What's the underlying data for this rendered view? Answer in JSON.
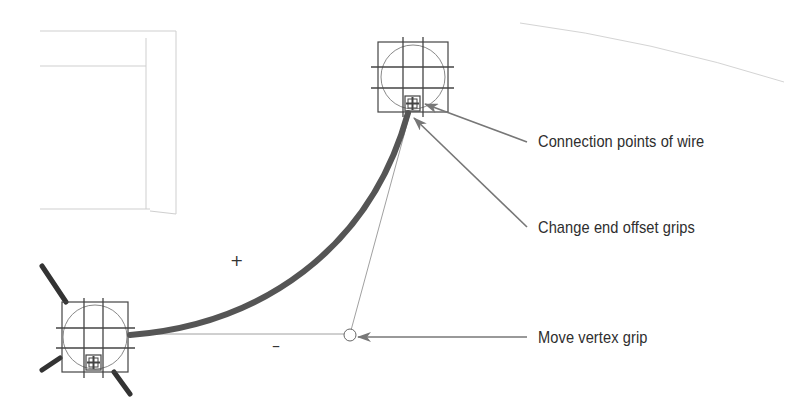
{
  "diagram": {
    "type": "wire-grip-callout",
    "callouts": [
      {
        "id": "connection-points",
        "label": "Connection points of wire"
      },
      {
        "id": "end-offset-grips",
        "label": "Change end offset grips"
      },
      {
        "id": "vertex-grip",
        "label": "Move vertex grip"
      }
    ],
    "signs": {
      "plus": "+",
      "minus": "–"
    },
    "colors": {
      "wire": "#555555",
      "frame": "#444444",
      "arrow": "#777777",
      "ghost_lines": "#c8c8c8",
      "text": "#2e2e2e"
    }
  }
}
